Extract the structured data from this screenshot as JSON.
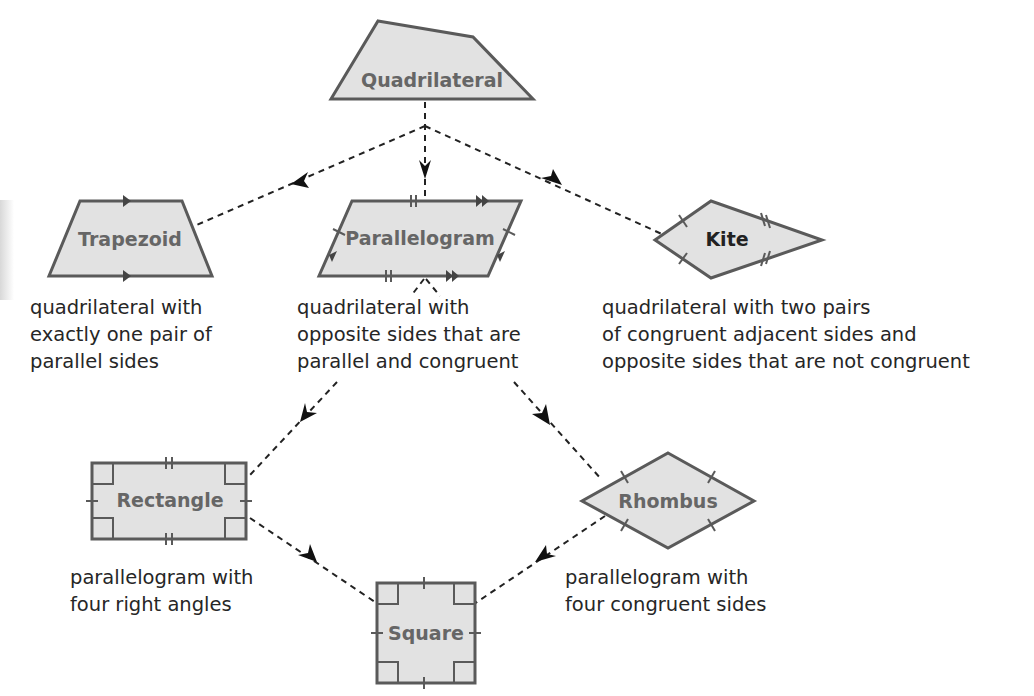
{
  "diagram": {
    "type": "hierarchy",
    "title": "",
    "colors": {
      "shape_fill": "#e2e2e2",
      "shape_stroke": "#5a5a5a",
      "label": "#666666",
      "text": "#262626",
      "edge": "#222222"
    },
    "nodes": {
      "quadrilateral": {
        "label": "Quadrilateral",
        "description": []
      },
      "trapezoid": {
        "label": "Trapezoid",
        "description": [
          "quadrilateral with",
          "exactly one pair of",
          "parallel sides"
        ]
      },
      "parallelogram": {
        "label": "Parallelogram",
        "description": [
          "quadrilateral with",
          "opposite sides that are",
          "parallel and congruent"
        ]
      },
      "kite": {
        "label": "Kite",
        "description": [
          "quadrilateral with two pairs",
          "of congruent adjacent sides and",
          "opposite sides that are not congruent"
        ]
      },
      "rectangle": {
        "label": "Rectangle",
        "description": [
          "parallelogram with",
          "four right angles"
        ]
      },
      "rhombus": {
        "label": "Rhombus",
        "description": [
          "parallelogram with",
          "four congruent sides"
        ]
      },
      "square": {
        "label": "Square",
        "description": []
      }
    },
    "edges": [
      {
        "from": "Quadrilateral",
        "to": "Trapezoid",
        "style": "dashed-arrow"
      },
      {
        "from": "Quadrilateral",
        "to": "Parallelogram",
        "style": "dashed-arrow"
      },
      {
        "from": "Quadrilateral",
        "to": "Kite",
        "style": "dashed-arrow"
      },
      {
        "from": "Parallelogram",
        "to": "Rectangle",
        "style": "dashed-arrow"
      },
      {
        "from": "Parallelogram",
        "to": "Rhombus",
        "style": "dashed-arrow"
      },
      {
        "from": "Rectangle",
        "to": "Square",
        "style": "dashed-arrow"
      },
      {
        "from": "Rhombus",
        "to": "Square",
        "style": "dashed-arrow"
      }
    ]
  }
}
